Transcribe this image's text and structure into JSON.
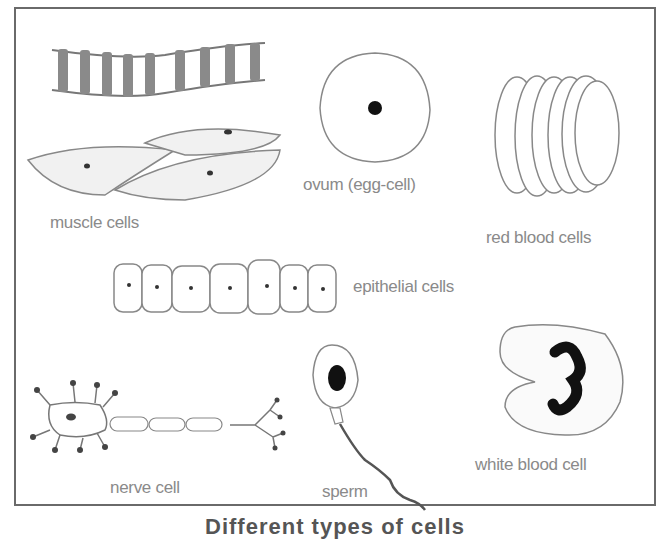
{
  "figure": {
    "caption": "Different types of cells",
    "cells": [
      {
        "id": "muscle",
        "label": "muscle cells"
      },
      {
        "id": "ovum",
        "label": "ovum (egg-cell)"
      },
      {
        "id": "rbc",
        "label": "red blood cells"
      },
      {
        "id": "epithelial",
        "label": "epithelial cells"
      },
      {
        "id": "nerve",
        "label": "nerve cell"
      },
      {
        "id": "sperm",
        "label": "sperm"
      },
      {
        "id": "wbc",
        "label": "white blood cell"
      }
    ],
    "colors": {
      "outline": "#7a7a7a",
      "nucleus": "#111111",
      "label": "#8a8a8a",
      "frame": "#6a6a6a"
    }
  }
}
